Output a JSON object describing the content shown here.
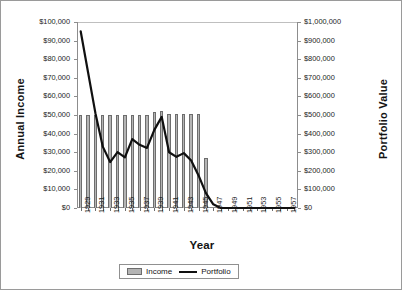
{
  "chart_data": {
    "type": "bar",
    "title": "",
    "xlabel": "Year",
    "ylabel": "Annual Income",
    "y2label": "Portfolio Value",
    "grid": false,
    "legend_position": "bottom",
    "ylim": [
      0,
      100000
    ],
    "y2lim": [
      0,
      1000000
    ],
    "xlim": [
      1929,
      1958
    ],
    "y_ticklabels": [
      "$0",
      "$10,000",
      "$20,000",
      "$30,000",
      "$40,000",
      "$50,000",
      "$60,000",
      "$70,000",
      "$80,000",
      "$90,000",
      "$100,000"
    ],
    "y2_ticklabels": [
      "$0",
      "$100,000",
      "$200,000",
      "$300,000",
      "$400,000",
      "$500,000",
      "$600,000",
      "$700,000",
      "$800,000",
      "$900,000",
      "$1,000,000"
    ],
    "categories": [
      1929,
      1930,
      1931,
      1932,
      1933,
      1934,
      1935,
      1936,
      1937,
      1938,
      1939,
      1940,
      1941,
      1942,
      1943,
      1944,
      1945,
      1946,
      1947,
      1948,
      1949,
      1950,
      1951,
      1952,
      1953,
      1954,
      1955,
      1956,
      1957,
      1958
    ],
    "x_ticklabels": [
      "1929",
      "",
      "1931",
      "",
      "1933",
      "",
      "1935",
      "",
      "1937",
      "",
      "1939",
      "",
      "1941",
      "",
      "1943",
      "",
      "1945",
      "",
      "1947",
      "",
      "1949",
      "",
      "1951",
      "",
      "1953",
      "",
      "1955",
      "",
      "1957",
      ""
    ],
    "series": [
      {
        "name": "Income",
        "type": "bar",
        "axis": "left",
        "color": "#b4b4b4",
        "edge_color": "#6d6d6d",
        "values": [
          50000,
          50000,
          50000,
          50000,
          50000,
          50000,
          50000,
          50000,
          50000,
          50000,
          51500,
          52000,
          50500,
          50500,
          50500,
          50500,
          50500,
          27000,
          0,
          0,
          0,
          0,
          0,
          0,
          0,
          0,
          0,
          0,
          0,
          0
        ]
      },
      {
        "name": "Portfolio",
        "type": "line",
        "axis": "right",
        "color": "#101010",
        "values": [
          950000,
          730000,
          510000,
          330000,
          247000,
          300000,
          272000,
          370000,
          340000,
          323000,
          420000,
          490000,
          300000,
          275000,
          295000,
          255000,
          175000,
          80000,
          20000,
          0,
          0,
          0,
          0,
          0,
          0,
          0,
          0,
          0,
          0,
          0
        ]
      }
    ]
  },
  "legend": {
    "items": [
      {
        "label": "Income",
        "marker": "bar-swatch"
      },
      {
        "label": "Portfolio",
        "marker": "line-swatch"
      }
    ]
  }
}
